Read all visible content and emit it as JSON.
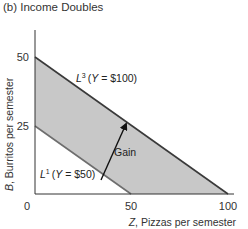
{
  "title": "(b) Income Doubles",
  "colors": {
    "band_fill": "#c8c8c8",
    "l3_line": "#3a3a3a",
    "l1_line": "#6e6e6e",
    "axis": "#333333",
    "arrow": "#111111"
  },
  "axes": {
    "x_label_var": "Z",
    "x_label_rest": ", Pizzas per semester",
    "y_label_var": "B",
    "y_label_rest": ", Burritos per semester",
    "x_ticks": [
      "0",
      "50",
      "100"
    ],
    "y_ticks": [
      "25",
      "50"
    ]
  },
  "labels": {
    "l3_L": "L",
    "l3_sup": "3",
    "l3_text": "(Y = $100)",
    "l1_L": "L",
    "l1_sup": "1",
    "l1_text": "(Y = $50)",
    "gain": "Gain"
  },
  "chart_data": {
    "type": "line",
    "title": "(b) Income Doubles",
    "xlabel": "Z, Pizzas per semester",
    "ylabel": "B, Burritos per semester",
    "xlim": [
      0,
      105
    ],
    "ylim": [
      0,
      57
    ],
    "x_ticks": [
      0,
      50,
      100
    ],
    "y_ticks": [
      25,
      50
    ],
    "grid": false,
    "series": [
      {
        "name": "L1 (Y = $50)",
        "x": [
          0,
          50
        ],
        "y": [
          25,
          0
        ]
      },
      {
        "name": "L3 (Y = $100)",
        "x": [
          0,
          100
        ],
        "y": [
          50,
          0
        ]
      }
    ],
    "shaded_region": "area between L1 and L3 (gain in opportunity set)",
    "annotations": [
      {
        "text": "Gain",
        "type": "arrow",
        "from_series": "L1",
        "to_series": "L3"
      },
      {
        "text": "L3 (Y = $100)"
      },
      {
        "text": "L1 (Y = $50)"
      }
    ]
  }
}
